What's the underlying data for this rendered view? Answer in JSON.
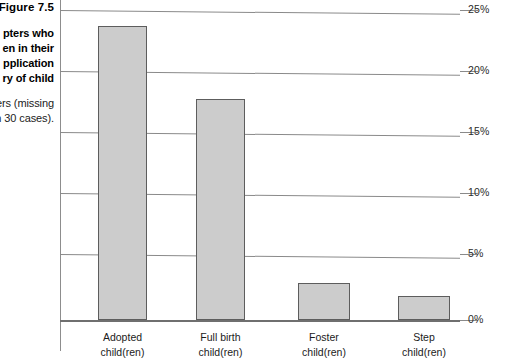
{
  "figure": {
    "number_label": "Figure 7.5",
    "caption_bold_lines": [
      "pters who",
      "en in their",
      "pplication",
      "ry of child"
    ],
    "caption_regular_lines": [
      "ers (missing",
      "n 30 cases)."
    ]
  },
  "colors": {
    "bar_fill": "#cccccc",
    "bar_border": "#5d5d5d",
    "gridline": "#8a8a8a",
    "axis": "#6f6f6f",
    "text": "#1b1b1b"
  },
  "chart_data": {
    "type": "bar",
    "title": "Figure 7.5",
    "xlabel": "",
    "ylabel": "",
    "categories": [
      "Adopted child(ren)",
      "Full birth child(ren)",
      "Foster child(ren)",
      "Step child(ren)"
    ],
    "category_lines": [
      [
        "Adopted",
        "child(ren)"
      ],
      [
        "Full birth",
        "child(ren)"
      ],
      [
        "Foster",
        "child(ren)"
      ],
      [
        "Step",
        "child(ren)"
      ]
    ],
    "values": [
      24.1,
      18.1,
      3.0,
      2.0
    ],
    "value_unit": "%",
    "ylim": [
      0,
      25
    ],
    "yticks": [
      0,
      5,
      10,
      15,
      20,
      25
    ],
    "ytick_labels": [
      "0%",
      "5%",
      "10%",
      "15%",
      "20%",
      "25%"
    ],
    "grid": true,
    "grid_axis": "y",
    "legend": null,
    "axis_position": "right"
  }
}
